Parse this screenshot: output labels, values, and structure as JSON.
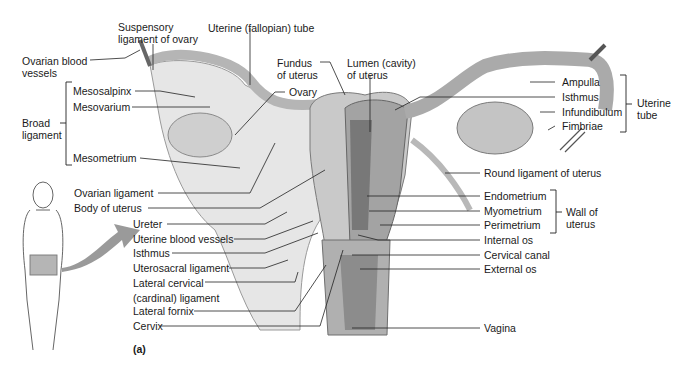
{
  "figure": {
    "panel_label": "(a)",
    "background": "#ffffff",
    "tissue_colors": {
      "light": "#d9d9d9",
      "mid": "#a8a8a8",
      "dark": "#6e6e6e",
      "arrow": "#9a9a9a"
    }
  },
  "labels": {
    "suspensory_ligament": [
      "Suspensory",
      "ligament of ovary"
    ],
    "uterine_fallopian_tube": "Uterine (fallopian) tube",
    "ovarian_blood_vessels": [
      "Ovarian blood",
      "vessels"
    ],
    "fundus": [
      "Fundus",
      "of uterus"
    ],
    "lumen": [
      "Lumen (cavity)",
      "of uterus"
    ],
    "mesosalpinx": "Mesosalpinx",
    "mesovarium": "Mesovarium",
    "ovary": "Ovary",
    "broad_ligament": [
      "Broad",
      "ligament"
    ],
    "mesometrium": "Mesometrium",
    "ampulla": "Ampulla",
    "isthmus_tube": "Isthmus",
    "infundibulum": "Infundibulum",
    "fimbriae": "Fimbriae",
    "uterine_tube": [
      "Uterine",
      "tube"
    ],
    "round_ligament": "Round ligament of uterus",
    "ovarian_ligament": "Ovarian ligament",
    "body_of_uterus": "Body of uterus",
    "ureter": "Ureter",
    "uterine_blood_vessels": "Uterine blood vessels",
    "isthmus_uterus": "Isthmus",
    "uterosacral_ligament": "Uterosacral ligament",
    "lateral_cervical": [
      "Lateral cervical",
      "(cardinal) ligament"
    ],
    "lateral_fornix": "Lateral fornix",
    "cervix": "Cervix",
    "endometrium": "Endometrium",
    "myometrium": "Myometrium",
    "perimetrium": "Perimetrium",
    "wall_of_uterus": [
      "Wall of",
      "uterus"
    ],
    "internal_os": "Internal os",
    "cervical_canal": "Cervical canal",
    "external_os": "External os",
    "vagina": "Vagina"
  }
}
